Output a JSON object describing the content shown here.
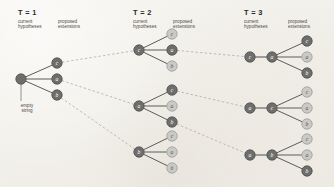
{
  "figure": {
    "kind": "hypothesis-expansion-tree",
    "alphabet": [
      "c",
      "a",
      "b"
    ],
    "background_color": "#f2f0ea",
    "colors": {
      "node_selected_fill": "#6e6e6c",
      "node_selected_stroke": "#4c4c4a",
      "node_selected_text": "#ffffff",
      "node_unselected_fill": "#c9c9c6",
      "node_unselected_stroke": "#9c9c99",
      "node_unselected_text": "#55554f",
      "edge_solid": "#5c5c5a",
      "edge_dashed": "#b3a9a4",
      "leader_line": "#7a7a77",
      "title_text": "#2a2a28",
      "caption_text": "#4a4945"
    }
  },
  "columns": [
    {
      "id": "t1",
      "title": "T = 1",
      "sub_current": "current\nhypotheses",
      "sub_current_line1": "current",
      "sub_current_line2": "hypotheses",
      "sub_proposed_line1": "proposed",
      "sub_proposed_line2": "extensions",
      "annotation_line1": "empty",
      "annotation_line2": "string",
      "groups": [
        {
          "id": "t1-g1",
          "parents": [
            {
              "label": "",
              "state": "selected"
            }
          ],
          "children": [
            {
              "label": "c",
              "state": "selected"
            },
            {
              "label": "a",
              "state": "selected"
            },
            {
              "label": "b",
              "state": "selected"
            }
          ]
        }
      ]
    },
    {
      "id": "t2",
      "title": "T = 2",
      "sub_current_line1": "current",
      "sub_current_line2": "hypotheses",
      "sub_proposed_line1": "proposed",
      "sub_proposed_line2": "extensions",
      "groups": [
        {
          "id": "t2-g1",
          "parents": [
            {
              "label": "c",
              "state": "selected"
            }
          ],
          "children": [
            {
              "label": "c",
              "state": "unselected"
            },
            {
              "label": "a",
              "state": "selected"
            },
            {
              "label": "b",
              "state": "unselected"
            }
          ]
        },
        {
          "id": "t2-g2",
          "parents": [
            {
              "label": "a",
              "state": "selected"
            }
          ],
          "children": [
            {
              "label": "c",
              "state": "selected"
            },
            {
              "label": "a",
              "state": "unselected"
            },
            {
              "label": "b",
              "state": "selected"
            }
          ]
        },
        {
          "id": "t2-g3",
          "parents": [
            {
              "label": "b",
              "state": "selected"
            }
          ],
          "children": [
            {
              "label": "c",
              "state": "unselected"
            },
            {
              "label": "a",
              "state": "unselected"
            },
            {
              "label": "b",
              "state": "unselected"
            }
          ]
        }
      ]
    },
    {
      "id": "t3",
      "title": "T = 3",
      "sub_current_line1": "current",
      "sub_current_line2": "hypotheses",
      "sub_proposed_line1": "proposed",
      "sub_proposed_line2": "extensions",
      "groups": [
        {
          "id": "t3-g1",
          "parents": [
            {
              "label": "c",
              "state": "selected"
            },
            {
              "label": "a",
              "state": "selected"
            }
          ],
          "children": [
            {
              "label": "c",
              "state": "selected"
            },
            {
              "label": "a",
              "state": "unselected"
            },
            {
              "label": "b",
              "state": "selected"
            }
          ]
        },
        {
          "id": "t3-g2",
          "parents": [
            {
              "label": "a",
              "state": "selected"
            },
            {
              "label": "c",
              "state": "selected"
            }
          ],
          "children": [
            {
              "label": "c",
              "state": "unselected"
            },
            {
              "label": "a",
              "state": "unselected"
            },
            {
              "label": "b",
              "state": "unselected"
            }
          ]
        },
        {
          "id": "t3-g3",
          "parents": [
            {
              "label": "a",
              "state": "selected"
            },
            {
              "label": "b",
              "state": "selected"
            }
          ],
          "children": [
            {
              "label": "c",
              "state": "unselected"
            },
            {
              "label": "a",
              "state": "unselected"
            },
            {
              "label": "b",
              "state": "selected"
            }
          ]
        }
      ]
    }
  ],
  "carryovers": [
    {
      "from": "t1-g1.child.0",
      "to": "t2-g1.parent.0"
    },
    {
      "from": "t1-g1.child.1",
      "to": "t2-g2.parent.0"
    },
    {
      "from": "t1-g1.child.2",
      "to": "t2-g3.parent.0"
    },
    {
      "from": "t2-g1.child.1",
      "to": "t3-g1.parent.0"
    },
    {
      "from": "t2-g2.child.0",
      "to": "t3-g2.parent.0"
    },
    {
      "from": "t2-g2.child.2",
      "to": "t3-g3.parent.0"
    }
  ]
}
